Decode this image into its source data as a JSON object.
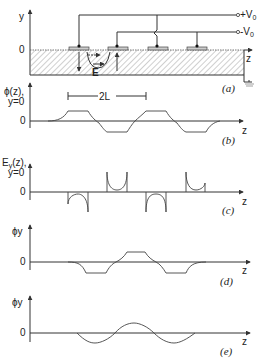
{
  "figure": {
    "panels": [
      {
        "id": "a",
        "caption": "(a)",
        "y_axis_label": "y",
        "y_zero_label": "0",
        "x_axis_label": "z",
        "terminals": {
          "positive": "+V",
          "positive_sub": "0",
          "negative": "-V",
          "negative_sub": "0"
        },
        "field_label": "E",
        "electrodes": 4
      },
      {
        "id": "b",
        "caption": "(b)",
        "y_axis_label_line1": "ϕ(z),",
        "y_axis_label_line2": "y=0",
        "zero_label": "0",
        "x_axis_label": "z",
        "period_label": "2L"
      },
      {
        "id": "c",
        "caption": "(c)",
        "y_axis_label_line1": "E",
        "y_axis_label_sub": "y",
        "y_axis_label_rest": "(z),",
        "y_axis_label_line2": "y=0",
        "zero_label": "0",
        "x_axis_label": "z"
      },
      {
        "id": "d",
        "caption": "(d)",
        "y_axis_label": "ϕy",
        "zero_label": "0",
        "x_axis_label": "z"
      },
      {
        "id": "e",
        "caption": "(e)",
        "y_axis_label": "ϕy",
        "zero_label": "0",
        "x_axis_label": "z"
      }
    ]
  }
}
